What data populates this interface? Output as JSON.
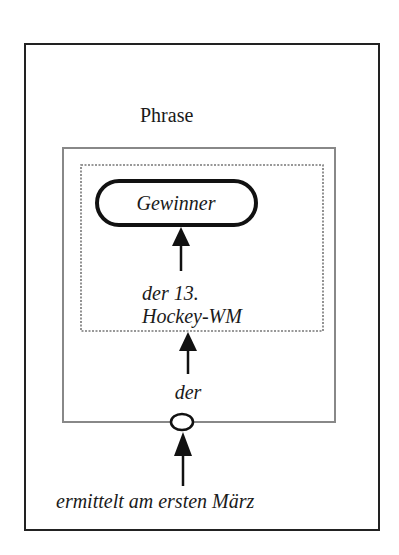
{
  "diagram": {
    "outer_box": {
      "label": "Phrase"
    },
    "head_node": {
      "label": "Gewinner"
    },
    "inner_modifier": {
      "line1": "der 13.",
      "line2": "Hockey-WM"
    },
    "determiner": {
      "label": "der"
    },
    "external_modifier": {
      "label": "ermittelt am ersten März"
    },
    "colors": {
      "stroke": "#111111",
      "box_gray": "#888888",
      "dashed": "#777777"
    }
  }
}
